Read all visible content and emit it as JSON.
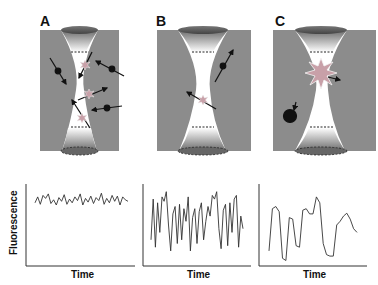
{
  "panels": [
    {
      "label": "A",
      "description": "Many molecules diffusing through confocal volume"
    },
    {
      "label": "B",
      "description": "Few molecules passing through volume"
    },
    {
      "label": "C",
      "description": "Single bright molecule in volume, one outside"
    }
  ],
  "colors": {
    "background_gray": "#8c8c8c",
    "beam_white": "#ffffff",
    "lens_dark": "#555555",
    "molecule": "#111111",
    "trace": "#333333"
  },
  "chart_data": [
    {
      "type": "line",
      "title": "",
      "xlabel": "Time",
      "ylabel": "Fluorescence",
      "description": "Small-amplitude rapid fluctuations around high mean",
      "x": [
        0,
        1,
        2,
        3,
        4,
        5,
        6,
        7,
        8,
        9,
        10,
        11,
        12,
        13,
        14,
        15,
        16,
        17,
        18,
        19,
        20,
        21,
        22,
        23,
        24,
        25,
        26,
        27,
        28,
        29,
        30,
        31,
        32,
        33,
        34,
        35
      ],
      "values": [
        0.8,
        0.88,
        0.78,
        0.9,
        0.86,
        0.92,
        0.79,
        0.84,
        0.77,
        0.87,
        0.82,
        0.91,
        0.78,
        0.85,
        0.8,
        0.88,
        0.83,
        0.92,
        0.77,
        0.86,
        0.81,
        0.89,
        0.79,
        0.87,
        0.83,
        0.93,
        0.78,
        0.86,
        0.8,
        0.9,
        0.82,
        0.89,
        0.77,
        0.88,
        0.84,
        0.82
      ],
      "ylim": [
        0,
        1
      ],
      "grid": false
    },
    {
      "type": "line",
      "title": "",
      "xlabel": "Time",
      "ylabel": "",
      "description": "Large-amplitude rapid fluctuations",
      "x": [
        0,
        1,
        2,
        3,
        4,
        5,
        6,
        7,
        8,
        9,
        10,
        11,
        12,
        13,
        14,
        15,
        16,
        17,
        18,
        19,
        20,
        21,
        22,
        23,
        24,
        25,
        26,
        27,
        28,
        29,
        30,
        31,
        32,
        33,
        34,
        35,
        36,
        37,
        38,
        39,
        40,
        41,
        42
      ],
      "values": [
        0.3,
        0.85,
        0.2,
        0.8,
        0.4,
        0.88,
        0.82,
        0.95,
        0.5,
        0.15,
        0.65,
        0.75,
        0.25,
        0.78,
        0.3,
        0.72,
        0.55,
        0.88,
        0.15,
        0.6,
        0.72,
        0.25,
        0.68,
        0.8,
        0.3,
        0.55,
        0.75,
        0.62,
        0.9,
        0.85,
        0.95,
        0.45,
        0.18,
        0.7,
        0.78,
        0.22,
        0.8,
        0.4,
        0.85,
        0.9,
        0.2,
        0.62,
        0.45
      ],
      "ylim": [
        0,
        1
      ],
      "grid": false
    },
    {
      "type": "line",
      "title": "",
      "xlabel": "Time",
      "ylabel": "",
      "description": "Slow large fluctuations from single molecule",
      "x": [
        0,
        1,
        2,
        3,
        4,
        5,
        6,
        7,
        8,
        9,
        10,
        11,
        12,
        13,
        14,
        15,
        16,
        17,
        18,
        19,
        20,
        21,
        22,
        23,
        24,
        25,
        26
      ],
      "values": [
        0.15,
        0.72,
        0.75,
        0.68,
        0.05,
        0.02,
        0.6,
        0.58,
        0.22,
        0.2,
        0.7,
        0.72,
        0.65,
        0.65,
        0.88,
        0.8,
        0.25,
        0.1,
        0.08,
        0.08,
        0.5,
        0.55,
        0.62,
        0.66,
        0.58,
        0.45,
        0.4
      ],
      "ylim": [
        0,
        1
      ],
      "grid": false
    }
  ],
  "charts": [
    {
      "xlabel": "Time",
      "ylabel": "Fluorescence"
    },
    {
      "xlabel": "Time"
    },
    {
      "xlabel": "Time"
    }
  ]
}
